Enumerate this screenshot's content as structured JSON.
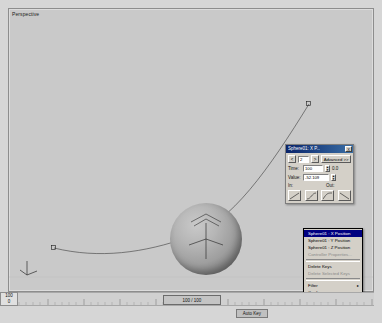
{
  "viewport": {
    "label": "Perspective",
    "object_name": "Sphere01",
    "keyframe_markers": [
      "a",
      "b"
    ]
  },
  "timeline": {
    "frame_field_value": "100",
    "frame_field_label": "0",
    "slider_label": "100 / 100",
    "auto_key_label": "Auto Key",
    "ticks": [
      "0",
      "10",
      "20",
      "30",
      "40",
      "50",
      "60",
      "70",
      "80",
      "90",
      "100"
    ]
  },
  "key_dialog": {
    "title": "Sphere01: X P...",
    "close_label": "X",
    "prev_key_label": "<",
    "key_index": "2",
    "next_key_label": ">",
    "advanced_label": "Advanced >>",
    "time_label": "Time:",
    "time_value": "100",
    "time_unit": "0.0",
    "value_label": "Value:",
    "value_value": "-52.109",
    "in_label": "In:",
    "out_label": "Out:",
    "tangent_in_icon": "tangent-linear-icon",
    "tangent_out_icon": "tangent-linear-icon"
  },
  "context_menu": {
    "items": [
      {
        "label": "Sphere01 : X Position",
        "type": "header",
        "submenu": false
      },
      {
        "label": "Sphere01 : Y Position",
        "type": "item",
        "submenu": false
      },
      {
        "label": "Sphere01 : Z Position",
        "type": "item",
        "submenu": false
      },
      {
        "label": "Controller Properties...",
        "type": "disabled",
        "submenu": false
      },
      {
        "label": "Delete Keys",
        "type": "item",
        "submenu": false
      },
      {
        "label": "Delete Selected Keys",
        "type": "disabled",
        "submenu": false
      },
      {
        "label": "Filter",
        "type": "item",
        "submenu": true
      },
      {
        "label": "Configure",
        "type": "item",
        "submenu": true
      },
      {
        "label": "Go to Time",
        "type": "item",
        "submenu": true
      }
    ]
  }
}
